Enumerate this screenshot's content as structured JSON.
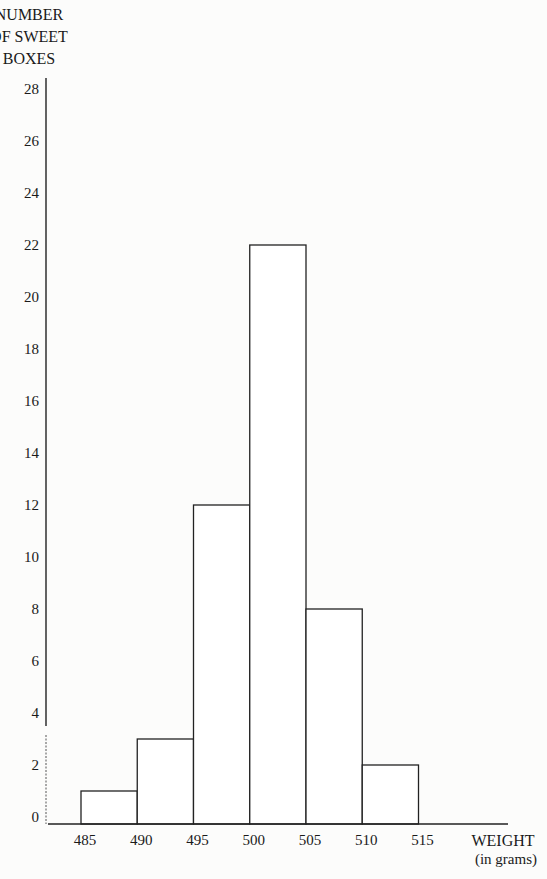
{
  "chart_data": {
    "type": "bar",
    "subtype": "histogram",
    "title": "",
    "ylabel_lines": [
      "NUMBER",
      "OF SWEET",
      "BOXES"
    ],
    "xlabel": "WEIGHT",
    "xlabel_unit": "(in grams)",
    "bin_edges": [
      485,
      490,
      495,
      500,
      505,
      510,
      515
    ],
    "x_tick_labels": [
      "485",
      "490",
      "495",
      "500",
      "505",
      "510",
      "515"
    ],
    "categories": [
      "485-490",
      "490-495",
      "495-500",
      "500-505",
      "505-510",
      "510-515"
    ],
    "values": [
      1,
      3,
      12,
      22,
      8,
      2
    ],
    "ylim": [
      0,
      28
    ],
    "y_ticks": [
      0,
      2,
      4,
      6,
      8,
      10,
      12,
      14,
      16,
      18,
      20,
      22,
      24,
      26,
      28
    ],
    "y_tick_labels": [
      "0",
      "2",
      "4",
      "6",
      "8",
      "10",
      "12",
      "14",
      "16",
      "18",
      "20",
      "22",
      "24",
      "26",
      "28"
    ],
    "grid": false,
    "legend": "none",
    "bar_fill": "#ffffff",
    "bar_stroke": "#222222"
  }
}
